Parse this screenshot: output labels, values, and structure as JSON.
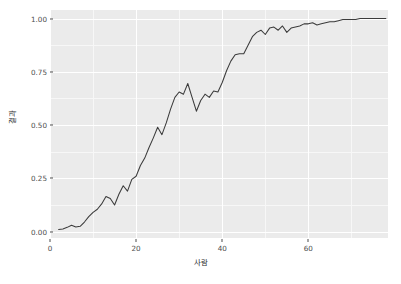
{
  "chart_data": {
    "type": "line",
    "title": "",
    "xlabel": "사람",
    "ylabel": "결과",
    "xlim": [
      0,
      78.5
    ],
    "ylim": [
      -0.03,
      1.04
    ],
    "xticks": [
      0,
      20,
      40,
      60
    ],
    "xtick_labels": [
      "0",
      "20",
      "40",
      "60"
    ],
    "yticks": [
      0.0,
      0.25,
      0.5,
      0.75,
      1.0
    ],
    "ytick_labels": [
      "0.00",
      "0.25",
      "0.50",
      "0.75",
      "1.00"
    ],
    "x_minor_ticks": [
      10,
      30,
      50,
      70
    ],
    "y_minor_ticks": [
      0.125,
      0.375,
      0.625,
      0.875
    ],
    "grid": true,
    "legend": "none",
    "panel_background": "#ebebeb",
    "grid_color": "#ffffff",
    "line_color": "#3b3b3b",
    "series": [
      {
        "name": "결과",
        "x": [
          2,
          3,
          4,
          5,
          6,
          7,
          8,
          9,
          10,
          11,
          12,
          13,
          14,
          15,
          16,
          17,
          18,
          19,
          20,
          21,
          22,
          23,
          24,
          25,
          26,
          27,
          28,
          29,
          30,
          31,
          32,
          33,
          34,
          35,
          36,
          37,
          38,
          39,
          40,
          41,
          42,
          43,
          44,
          45,
          46,
          47,
          48,
          49,
          50,
          51,
          52,
          53,
          54,
          55,
          56,
          57,
          58,
          59,
          60,
          61,
          62,
          63,
          64,
          65,
          66,
          67,
          68,
          69,
          70,
          71,
          72,
          73,
          74,
          75,
          76,
          77,
          78
        ],
        "y": [
          0.01,
          0.012,
          0.02,
          0.03,
          0.022,
          0.025,
          0.045,
          0.07,
          0.09,
          0.105,
          0.13,
          0.165,
          0.155,
          0.125,
          0.175,
          0.215,
          0.19,
          0.245,
          0.26,
          0.31,
          0.345,
          0.395,
          0.44,
          0.49,
          0.455,
          0.51,
          0.575,
          0.63,
          0.655,
          0.645,
          0.695,
          0.63,
          0.565,
          0.615,
          0.645,
          0.63,
          0.66,
          0.655,
          0.7,
          0.755,
          0.8,
          0.83,
          0.835,
          0.835,
          0.875,
          0.915,
          0.935,
          0.945,
          0.925,
          0.955,
          0.96,
          0.945,
          0.965,
          0.935,
          0.955,
          0.96,
          0.965,
          0.975,
          0.975,
          0.98,
          0.97,
          0.975,
          0.98,
          0.985,
          0.985,
          0.99,
          0.995,
          0.995,
          0.995,
          0.995,
          1.0,
          1.0,
          1.0,
          1.0,
          1.0,
          1.0,
          1.0
        ]
      }
    ]
  }
}
